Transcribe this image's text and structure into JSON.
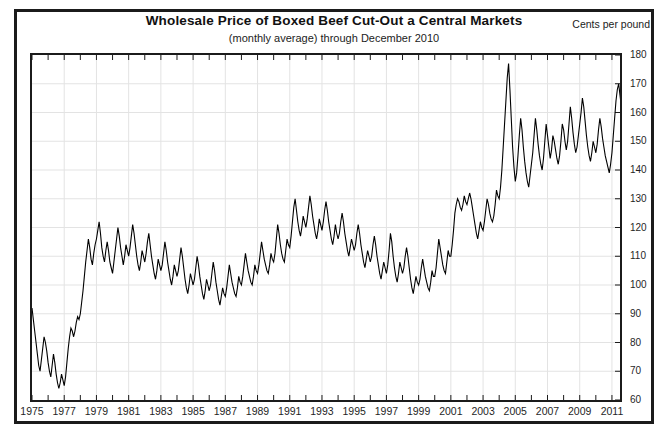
{
  "figure": {
    "units_label": "Cents per pound"
  },
  "chart_data": {
    "type": "line",
    "title": "Wholesale Price of Boxed Beef Cut-Out a Central Markets",
    "subtitle": "(monthly average) through December 2010",
    "xlabel": "",
    "ylabel": "Cents per pound",
    "ylim": [
      60,
      180
    ],
    "xlim": [
      1975,
      2011.5
    ],
    "grid": true,
    "legend": false,
    "y_ticks": [
      180,
      170,
      160,
      150,
      140,
      130,
      120,
      110,
      100,
      90,
      80,
      70,
      60
    ],
    "y_tick_labels": [
      "180",
      "170",
      "160",
      "150",
      "140",
      "130",
      "120",
      "110",
      "100",
      "90",
      "80",
      "70",
      "60"
    ],
    "x_ticks": [
      1975,
      1977,
      1979,
      1981,
      1983,
      1985,
      1987,
      1989,
      1991,
      1993,
      1995,
      1997,
      1999,
      2001,
      2003,
      2005,
      2007,
      2009,
      2011
    ],
    "x_tick_labels": [
      "1975",
      "1977",
      "1979",
      "1981",
      "1983",
      "1985",
      "1987",
      "1989",
      "1991",
      "1993",
      "1995",
      "1997",
      "1999",
      "2001",
      "2003",
      "2005",
      "2007",
      "2009",
      "2011"
    ],
    "x_minor_tick_step": 1,
    "series_name": "Boxed Beef Cut-Out Wholesale Price",
    "x_start": 1975.0,
    "x_step_months": 1,
    "line_color": "#000000",
    "line_width": 1.1,
    "values": [
      92,
      88,
      84,
      80,
      76,
      72,
      70,
      74,
      78,
      82,
      80,
      77,
      73,
      70,
      68,
      72,
      76,
      73,
      69,
      66,
      64,
      66,
      69,
      67,
      65,
      68,
      73,
      78,
      82,
      85,
      84,
      82,
      84,
      87,
      89,
      88,
      90,
      94,
      98,
      103,
      108,
      112,
      116,
      113,
      109,
      107,
      111,
      114,
      116,
      119,
      122,
      118,
      113,
      110,
      108,
      112,
      115,
      112,
      108,
      106,
      104,
      108,
      112,
      116,
      120,
      117,
      113,
      110,
      107,
      110,
      114,
      112,
      110,
      113,
      117,
      121,
      118,
      114,
      110,
      107,
      105,
      108,
      112,
      110,
      108,
      111,
      115,
      118,
      114,
      110,
      107,
      104,
      102,
      105,
      109,
      107,
      105,
      107,
      111,
      115,
      112,
      108,
      105,
      102,
      100,
      103,
      107,
      105,
      103,
      105,
      109,
      113,
      110,
      106,
      102,
      99,
      97,
      100,
      104,
      102,
      100,
      102,
      106,
      110,
      107,
      103,
      100,
      97,
      95,
      98,
      102,
      100,
      98,
      100,
      104,
      108,
      105,
      101,
      98,
      95,
      93,
      96,
      99,
      97,
      96,
      99,
      103,
      107,
      104,
      101,
      99,
      97,
      96,
      99,
      103,
      101,
      100,
      103,
      107,
      111,
      108,
      105,
      103,
      101,
      100,
      103,
      107,
      105,
      104,
      107,
      111,
      115,
      112,
      109,
      107,
      105,
      104,
      107,
      111,
      109,
      108,
      111,
      116,
      121,
      118,
      114,
      111,
      109,
      108,
      112,
      116,
      114,
      113,
      117,
      122,
      127,
      130,
      126,
      122,
      119,
      117,
      120,
      124,
      122,
      120,
      123,
      127,
      131,
      128,
      124,
      121,
      118,
      116,
      119,
      123,
      121,
      119,
      122,
      126,
      129,
      126,
      122,
      119,
      116,
      114,
      117,
      121,
      118,
      116,
      118,
      122,
      125,
      122,
      118,
      115,
      112,
      110,
      113,
      116,
      114,
      112,
      114,
      118,
      121,
      118,
      114,
      111,
      108,
      106,
      109,
      112,
      110,
      108,
      110,
      114,
      117,
      114,
      110,
      107,
      104,
      102,
      105,
      108,
      106,
      104,
      107,
      112,
      118,
      115,
      110,
      106,
      103,
      101,
      104,
      108,
      106,
      104,
      106,
      110,
      113,
      110,
      106,
      102,
      99,
      97,
      100,
      103,
      101,
      100,
      102,
      106,
      109,
      106,
      103,
      101,
      99,
      98,
      101,
      105,
      103,
      103,
      106,
      111,
      116,
      113,
      110,
      107,
      105,
      104,
      108,
      112,
      110,
      110,
      114,
      119,
      125,
      128,
      130,
      129,
      127,
      126,
      128,
      131,
      129,
      128,
      130,
      132,
      130,
      127,
      124,
      121,
      118,
      116,
      119,
      122,
      120,
      119,
      122,
      126,
      130,
      128,
      125,
      123,
      122,
      124,
      128,
      133,
      131,
      130,
      134,
      140,
      148,
      156,
      164,
      172,
      177,
      168,
      158,
      148,
      141,
      136,
      139,
      145,
      152,
      158,
      154,
      148,
      143,
      139,
      136,
      134,
      138,
      142,
      146,
      152,
      158,
      154,
      149,
      145,
      142,
      140,
      144,
      150,
      156,
      152,
      148,
      144,
      147,
      152,
      150,
      147,
      144,
      142,
      145,
      150,
      156,
      154,
      150,
      147,
      150,
      156,
      162,
      158,
      153,
      149,
      146,
      148,
      152,
      156,
      160,
      165,
      162,
      157,
      152,
      148,
      145,
      143,
      146,
      150,
      148,
      146,
      149,
      154,
      158,
      155,
      151,
      148,
      145,
      143,
      141,
      139,
      142,
      146,
      152,
      158,
      164,
      168,
      170,
      166,
      162,
      159,
      161,
      163,
      160
    ]
  }
}
